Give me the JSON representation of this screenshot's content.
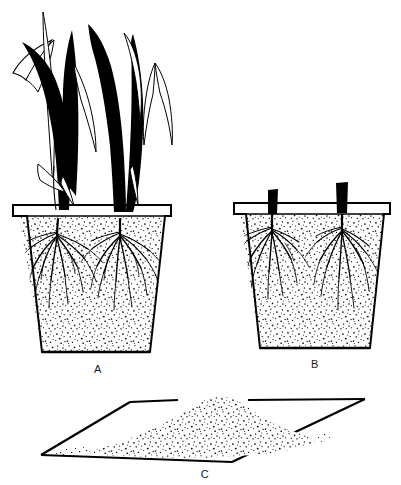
{
  "figure": {
    "kind": "scientific-line-illustration",
    "background_color": "#ffffff",
    "ink_color": "#000000",
    "width": 401,
    "height": 485
  },
  "panels": [
    {
      "id": "A",
      "label": "A",
      "label_x": 98,
      "label_y": 373,
      "description": "Flower pot filled with stippled soil containing two intact grass plants with full leafy shoots above the rim and fibrous root systems below.",
      "contents": {
        "pot": "tapered-flower-pot",
        "soil": "stippled-soil-fill",
        "plants": 2,
        "shoots": "intact-tall-leaves",
        "roots": "fibrous-root-system"
      }
    },
    {
      "id": "B",
      "label": "B",
      "label_x": 315,
      "label_y": 368,
      "description": "Identical flower pot with stippled soil where both grass plants have been clipped to short dark stem stubs at the soil surface, roots still intact below.",
      "contents": {
        "pot": "tapered-flower-pot",
        "soil": "stippled-soil-fill",
        "plants": 2,
        "shoots": "cut-stem-stubs",
        "roots": "fibrous-root-system"
      }
    },
    {
      "id": "C",
      "label": "C",
      "label_x": 205,
      "label_y": 478,
      "description": "Flat square tray shown in perspective holding a loose mound of stippled soil or substrate.",
      "contents": {
        "tray": "flat-square-tray-perspective",
        "soil": "loose-soil-mound"
      }
    }
  ],
  "colors": {
    "ink": "#000000",
    "soil_stipple": "#1a1a1a",
    "paper": "#ffffff",
    "label": "#1a1a1a"
  }
}
